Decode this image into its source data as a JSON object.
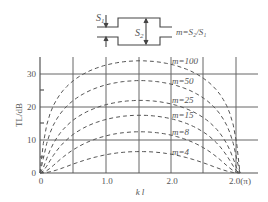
{
  "diagram": {
    "s1_label": "S",
    "s1_sub": "1",
    "s2_label": "S",
    "s2_sub": "2",
    "formula": "m=S₂/S₁"
  },
  "chart_data": {
    "type": "line",
    "title": "",
    "xlabel": "k l",
    "ylabel": "TL/dB",
    "xlim": [
      0,
      3.14
    ],
    "ylim": [
      0,
      35
    ],
    "x_ticks": [
      "0",
      "1.0",
      "2.0",
      "2.0(π)"
    ],
    "y_ticks": [
      "0",
      "10",
      "20",
      "30"
    ],
    "grid": true,
    "line_style": "dashed",
    "series": [
      {
        "name": "m=100",
        "peak": 34.0
      },
      {
        "name": "m=50",
        "peak": 28.0
      },
      {
        "name": "m=25",
        "peak": 22.0
      },
      {
        "name": "m=15",
        "peak": 17.5
      },
      {
        "name": "m=8",
        "peak": 12.5
      },
      {
        "name": "m=4",
        "peak": 6.5
      }
    ],
    "x": [
      0,
      0.39,
      0.79,
      1.18,
      1.57,
      1.96,
      2.36,
      2.75,
      3.14
    ]
  }
}
